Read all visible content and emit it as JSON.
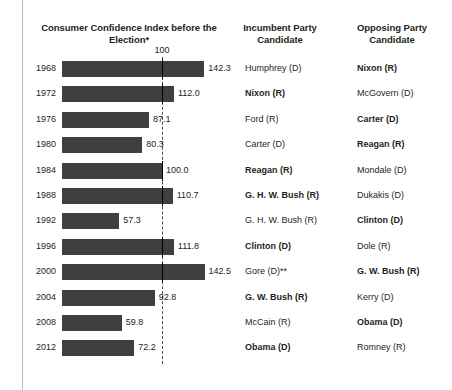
{
  "headers": {
    "chart": "Consumer Confidence Index before the Election*",
    "incumbent": "Incumbent Party Candidate",
    "opposing": "Opposing Party Candidate"
  },
  "axis": {
    "reference_label": "100"
  },
  "chart_data": {
    "type": "bar",
    "title": "Consumer Confidence Index before the Election*",
    "xlabel": "",
    "ylabel": "",
    "orientation": "horizontal",
    "reference_line": 100,
    "xlim": [
      0,
      150
    ],
    "grid": false,
    "legend": null,
    "bar_color": "#3f3f3f",
    "categories": [
      "1968",
      "1972",
      "1976",
      "1980",
      "1984",
      "1988",
      "1992",
      "1996",
      "2000",
      "2004",
      "2008",
      "2012"
    ],
    "values": [
      142.3,
      112.0,
      87.1,
      80.3,
      100.0,
      110.7,
      57.3,
      111.8,
      142.5,
      92.8,
      59.8,
      72.2
    ],
    "value_labels": [
      "142.3",
      "112.0",
      "87.1",
      "80.3",
      "100.0",
      "110.7",
      "57.3",
      "111.8",
      "142.5",
      "92.8",
      "59.8",
      "72.2"
    ]
  },
  "rows": [
    {
      "year": "1968",
      "value": 142.3,
      "value_label": "142.3",
      "incumbent": "Humphrey (D)",
      "incumbent_winner": false,
      "opposing": "Nixon (R)",
      "opposing_winner": true
    },
    {
      "year": "1972",
      "value": 112.0,
      "value_label": "112.0",
      "incumbent": "Nixon (R)",
      "incumbent_winner": true,
      "opposing": "McGovern (D)",
      "opposing_winner": false
    },
    {
      "year": "1976",
      "value": 87.1,
      "value_label": "87.1",
      "incumbent": "Ford (R)",
      "incumbent_winner": false,
      "opposing": "Carter (D)",
      "opposing_winner": true
    },
    {
      "year": "1980",
      "value": 80.3,
      "value_label": "80.3",
      "incumbent": "Carter (D)",
      "incumbent_winner": false,
      "opposing": "Reagan (R)",
      "opposing_winner": true
    },
    {
      "year": "1984",
      "value": 100.0,
      "value_label": "100.0",
      "incumbent": "Reagan (R)",
      "incumbent_winner": true,
      "opposing": "Mondale (D)",
      "opposing_winner": false
    },
    {
      "year": "1988",
      "value": 110.7,
      "value_label": "110.7",
      "incumbent": "G. H. W. Bush (R)",
      "incumbent_winner": true,
      "opposing": "Dukakis (D)",
      "opposing_winner": false
    },
    {
      "year": "1992",
      "value": 57.3,
      "value_label": "57.3",
      "incumbent": "G. H. W. Bush (R)",
      "incumbent_winner": false,
      "opposing": "Clinton (D)",
      "opposing_winner": true
    },
    {
      "year": "1996",
      "value": 111.8,
      "value_label": "111.8",
      "incumbent": "Clinton (D)",
      "incumbent_winner": true,
      "opposing": "Dole (R)",
      "opposing_winner": false
    },
    {
      "year": "2000",
      "value": 142.5,
      "value_label": "142.5",
      "incumbent": "Gore (D)**",
      "incumbent_winner": false,
      "opposing": "G. W. Bush (R)",
      "opposing_winner": true
    },
    {
      "year": "2004",
      "value": 92.8,
      "value_label": "92.8",
      "incumbent": "G. W. Bush (R)",
      "incumbent_winner": true,
      "opposing": "Kerry (D)",
      "opposing_winner": false
    },
    {
      "year": "2008",
      "value": 59.8,
      "value_label": "59.8",
      "incumbent": "McCain (R)",
      "incumbent_winner": false,
      "opposing": "Obama (D)",
      "opposing_winner": true
    },
    {
      "year": "2012",
      "value": 72.2,
      "value_label": "72.2",
      "incumbent": "Obama (D)",
      "incumbent_winner": true,
      "opposing": "Romney (R)",
      "opposing_winner": false
    }
  ]
}
